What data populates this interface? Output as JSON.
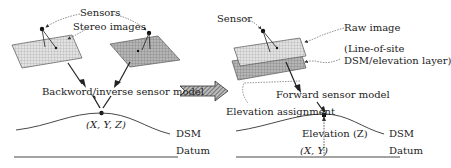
{
  "left_panel": {
    "sensors_label": "Sensors",
    "stereo_images_label": "Stereo images",
    "model_label": "Backword/inverse sensor model",
    "point_label": "(X, Y, Z)",
    "dsm_label": "DSM",
    "datum_label": "Datum"
  },
  "transition_arrow": {
    "icon": "hatched-right-arrow"
  },
  "right_panel": {
    "sensor_label": "Sensor",
    "raw_image_label": "Raw image",
    "line_of_site_label": "(Line-of-site",
    "dsm_layer_label": "DSM/elevation layer)",
    "model_label": "Forward sensor model",
    "elevation_assignment_label": "Elevation assignment",
    "elevation_label": "Elevation (Z)",
    "xy_label": "(X, Y)",
    "dsm_label": "DSM",
    "datum_label": "Datum"
  },
  "colors": {
    "line": "#333333",
    "plane_fill": "#d9d9d9",
    "plane_fill_dark": "#a9a9a9",
    "dashed": "#555555"
  }
}
